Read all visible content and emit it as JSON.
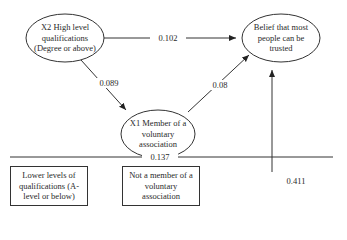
{
  "nodes": {
    "x2": {
      "label": "X2 High level qualifications (Degree or above)"
    },
    "belief": {
      "label": "Belief that most people can be trusted"
    },
    "x1": {
      "label": "X1 Member of a voluntary association"
    }
  },
  "reference_boxes": {
    "lower_quals": {
      "label": "Lower levels of qualifications (A-level or below)"
    },
    "not_member": {
      "label": "Not a member of a voluntary association"
    }
  },
  "paths": {
    "x2_to_belief": "0.102",
    "x2_to_x1": "0.089",
    "x1_to_belief": "0.08",
    "baseline": "0.137",
    "intercept": "0.411"
  },
  "colors": {
    "stroke": "#333333",
    "text": "#2a2a2a",
    "background": "#ffffff"
  }
}
